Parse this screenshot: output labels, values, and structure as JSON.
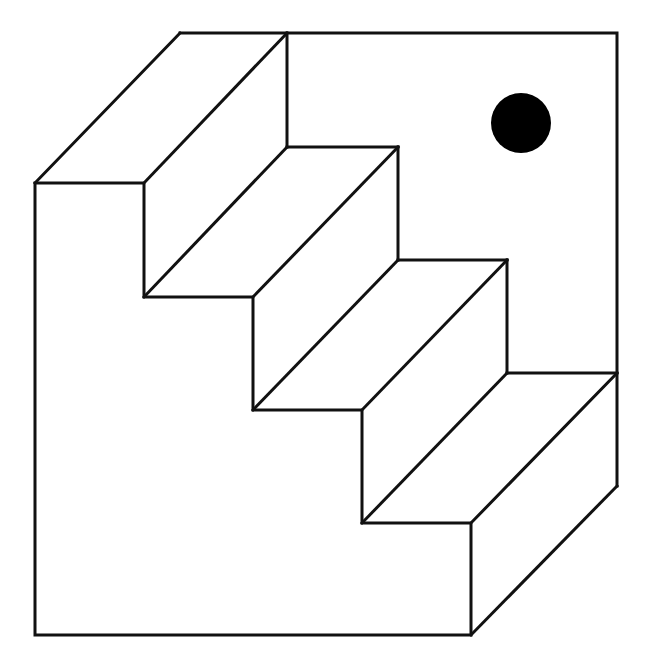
{
  "figure": {
    "stroke_color": "#111111",
    "background_color": "#ffffff",
    "dot_color": "#000000",
    "oblique_offset": {
      "dx": 145,
      "dy": -150
    },
    "front_outline": [
      [
        35,
        183
      ],
      [
        144,
        183
      ],
      [
        144,
        297
      ],
      [
        253,
        297
      ],
      [
        253,
        410
      ],
      [
        362,
        410
      ],
      [
        362,
        523
      ],
      [
        471,
        523
      ],
      [
        471,
        635
      ],
      [
        35,
        635
      ],
      [
        35,
        183
      ]
    ],
    "back_outline": [
      [
        180,
        33
      ],
      [
        617,
        33
      ],
      [
        617,
        486
      ]
    ],
    "depth_edges": [
      [
        [
          35,
          183
        ],
        [
          180,
          33
        ]
      ],
      [
        [
          144,
          183
        ],
        [
          287,
          33
        ]
      ],
      [
        [
          144,
          297
        ],
        [
          287,
          147
        ]
      ],
      [
        [
          253,
          297
        ],
        [
          398,
          147
        ]
      ],
      [
        [
          253,
          410
        ],
        [
          398,
          260
        ]
      ],
      [
        [
          362,
          410
        ],
        [
          507,
          260
        ]
      ],
      [
        [
          362,
          523
        ],
        [
          507,
          373
        ]
      ],
      [
        [
          471,
          523
        ],
        [
          617,
          373
        ]
      ],
      [
        [
          471,
          635
        ],
        [
          617,
          486
        ]
      ]
    ],
    "back_risers": [
      [
        [
          287,
          33
        ],
        [
          287,
          147
        ]
      ],
      [
        [
          398,
          147
        ],
        [
          398,
          260
        ]
      ],
      [
        [
          507,
          260
        ],
        [
          507,
          373
        ]
      ]
    ],
    "back_treads": [
      [
        [
          287,
          147
        ],
        [
          398,
          147
        ]
      ],
      [
        [
          398,
          260
        ],
        [
          507,
          260
        ]
      ],
      [
        [
          507,
          373
        ],
        [
          617,
          373
        ]
      ]
    ],
    "dot": {
      "cx": 521,
      "cy": 123,
      "r": 30
    }
  }
}
